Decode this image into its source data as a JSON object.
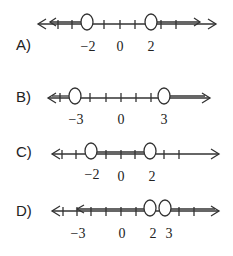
{
  "options": [
    {
      "label": "A)",
      "ticks": [
        "−2",
        "0",
        "2"
      ]
    },
    {
      "label": "B)",
      "ticks": [
        "−3",
        "0",
        "3"
      ]
    },
    {
      "label": "C)",
      "ticks": [
        "−2",
        "0",
        "2"
      ]
    },
    {
      "label": "D)",
      "ticks": [
        "−3",
        "0",
        "2",
        "3"
      ]
    }
  ]
}
